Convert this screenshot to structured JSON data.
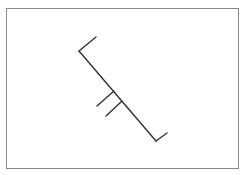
{
  "figure": {
    "frame": {
      "x": 6,
      "y": 8,
      "width": 234,
      "height": 162,
      "stroke": "#8a8a8a"
    },
    "stroke_color": "#333333",
    "stroke_width": 1.4,
    "segments": [
      {
        "name": "top-arm",
        "x1": 79,
        "y1": 51,
        "x2": 96,
        "y2": 37
      },
      {
        "name": "main-line",
        "x1": 79,
        "y1": 51,
        "x2": 156,
        "y2": 141
      },
      {
        "name": "bottom-arm",
        "x1": 156,
        "y1": 141,
        "x2": 167,
        "y2": 133
      },
      {
        "name": "tick-1",
        "x1": 114,
        "y1": 91,
        "x2": 97,
        "y2": 106
      },
      {
        "name": "tick-2",
        "x1": 122,
        "y1": 101,
        "x2": 106,
        "y2": 116
      }
    ]
  }
}
